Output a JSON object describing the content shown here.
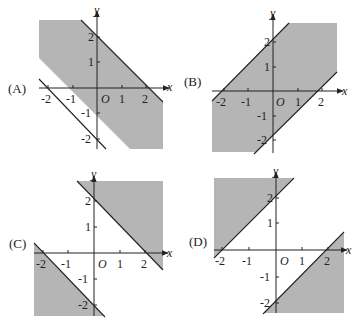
{
  "figure": {
    "unit_px": 24.5,
    "shade_color": "#b5b5b5",
    "line_color": "#222222",
    "axis_labels": {
      "x": "x",
      "y": "y",
      "origin": "O"
    },
    "x_ticks": [
      "-2",
      "-1",
      "1",
      "2"
    ],
    "y_ticks": [
      "2",
      "1",
      "-1",
      "-2"
    ],
    "panels": [
      {
        "id": "A",
        "label": "(A)",
        "origin": [
          97,
          88
        ],
        "region": "-2 <= x + y <= 2",
        "boundary_lines": [
          "y = -x + 2",
          "y = -x - 2"
        ],
        "shaded": "band between lines"
      },
      {
        "id": "B",
        "label": "(B)",
        "origin": [
          273,
          91
        ],
        "region": "-2 <= y - x <= 2",
        "boundary_lines": [
          "y = x + 2",
          "y = x - 2"
        ],
        "shaded": "band between lines"
      },
      {
        "id": "C",
        "label": "(C)",
        "origin": [
          94,
          253
        ],
        "region": "x + y >= 2 or x + y <= -2",
        "boundary_lines": [
          "y = -x + 2",
          "y = -x - 2"
        ],
        "shaded": "outside band (upper-right and lower-left)"
      },
      {
        "id": "D",
        "label": "(D)",
        "origin": [
          276,
          250
        ],
        "region": "y - x >= 2 or y - x <= -2",
        "boundary_lines": [
          "y = x + 2",
          "y = x - 2"
        ],
        "shaded": "outside band (upper-left and lower-right)"
      }
    ]
  }
}
